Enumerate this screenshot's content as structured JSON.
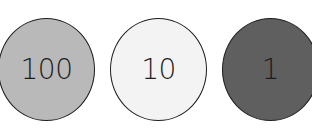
{
  "coins": [
    {
      "value": "100",
      "color": "#b9b9b9"
    },
    {
      "value": "10",
      "color": "#f3f3f3"
    },
    {
      "value": "1",
      "color": "#5f5f5f"
    }
  ]
}
